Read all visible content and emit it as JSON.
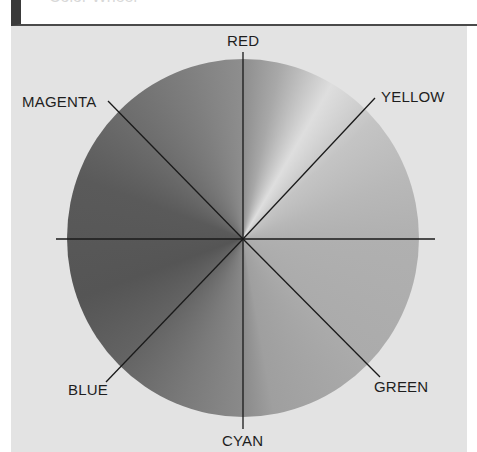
{
  "header": {
    "title": "Color Wheel"
  },
  "diagram": {
    "type": "color-wheel",
    "rendering": "grayscale",
    "center": [
      243,
      239
    ],
    "labels": {
      "top": "RED",
      "top_right": "YELLOW",
      "bottom_right": "GREEN",
      "bottom": "CYAN",
      "bottom_left": "BLUE",
      "top_left": "MAGENTA"
    }
  },
  "colors": {
    "background": "#e3e3e3",
    "frame": "#3a3a3a",
    "line": "#1a1a1a",
    "label_text": "#1e1e1e"
  }
}
